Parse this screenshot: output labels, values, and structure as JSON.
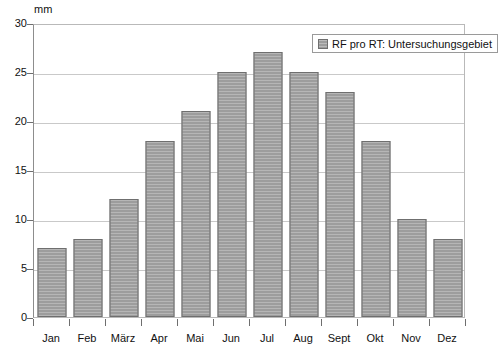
{
  "chart_data": {
    "type": "bar",
    "title": "",
    "subtitle": "",
    "xlabel": "",
    "ylabel": "mm",
    "unit_label": "mm",
    "categories": [
      "Jan",
      "Feb",
      "März",
      "Apr",
      "Mai",
      "Jun",
      "Jul",
      "Aug",
      "Sept",
      "Okt",
      "Nov",
      "Dez"
    ],
    "values": [
      7,
      8,
      12,
      18,
      21,
      25,
      27,
      25,
      23,
      18,
      10,
      8
    ],
    "series": [
      {
        "name": "RF pro RT: Untersuchungsgebiet",
        "values": [
          7,
          8,
          12,
          18,
          21,
          25,
          27,
          25,
          23,
          18,
          10,
          8
        ]
      }
    ],
    "ylim": [
      0,
      30
    ],
    "yticks": [
      0,
      5,
      10,
      15,
      20,
      25,
      30
    ],
    "ytick_labels": [
      "0",
      "5",
      "10",
      "15",
      "20",
      "25",
      "30"
    ],
    "grid": true,
    "grid_axis": "y",
    "legend": {
      "position": "top-right",
      "entries": [
        {
          "label": "RF pro RT: Untersuchungsgebiet",
          "color": "#9d9d9d"
        }
      ]
    },
    "colors": {
      "bar_fill": "#9d9d9d",
      "bar_border": "#6f6f6f",
      "gridline": "#c9c9c9",
      "axis": "#8d8d8d",
      "text": "#111111",
      "background": "#ffffff"
    }
  }
}
